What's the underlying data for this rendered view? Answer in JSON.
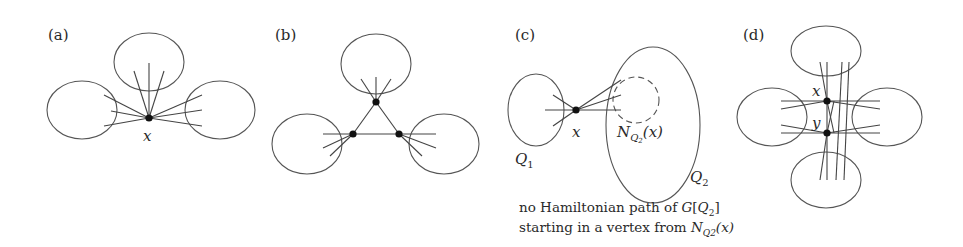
{
  "figure": {
    "panels": [
      {
        "id": "a",
        "label": "(a)",
        "vertex_labels": [
          "x"
        ]
      },
      {
        "id": "b",
        "label": "(b)",
        "vertex_labels": []
      },
      {
        "id": "c",
        "label": "(c)",
        "vertex_labels": [
          "x"
        ],
        "set_labels": [
          "Q1",
          "Q2"
        ],
        "neighborhood_label": "N_{Q2}(x)"
      },
      {
        "id": "d",
        "label": "(d)",
        "vertex_labels": [
          "x",
          "y"
        ]
      }
    ],
    "panel_c": {
      "x_label": "x",
      "q1_main": "Q",
      "q1_sub": "1",
      "q2_main": "Q",
      "q2_sub": "2",
      "n_main": "N",
      "n_sub": "Q",
      "n_subsub": "2",
      "n_arg": "(x)",
      "caption_line1_text": "no Hamiltonian path of ",
      "caption_line1_math": "G",
      "caption_line1_bracket_open": "[",
      "caption_line1_q": "Q",
      "caption_line1_q_sub": "2",
      "caption_line1_bracket_close": "]",
      "caption_line2_text": "starting in a vertex from ",
      "caption_line2_math": "N",
      "caption_line2_sub": "Q2",
      "caption_line2_arg": "(x)"
    },
    "panel_a": {
      "x_label": "x"
    },
    "panel_d": {
      "x_label": "x",
      "y_label": "y"
    },
    "colors": {
      "stroke": "#555555",
      "vertex": "#111111",
      "text": "#2a2a2a",
      "background": "#ffffff"
    }
  }
}
